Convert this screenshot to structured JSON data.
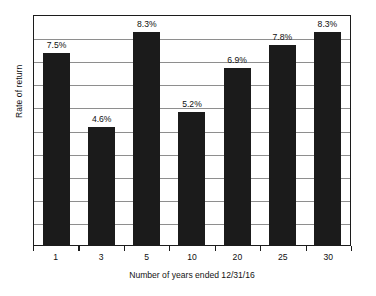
{
  "chart_data": {
    "type": "bar",
    "title": "",
    "xlabel": "Number of years ended 12/31/16",
    "ylabel": "Rate of return",
    "categories": [
      "1",
      "3",
      "5",
      "10",
      "20",
      "25",
      "30"
    ],
    "values": [
      7.5,
      4.6,
      8.3,
      5.2,
      6.9,
      7.8,
      8.3
    ],
    "value_labels": [
      "7.5%",
      "4.6%",
      "8.3%",
      "5.2%",
      "6.9%",
      "7.8%",
      "8.3%"
    ],
    "ylim": [
      0,
      9.0
    ],
    "ytick_labels": [],
    "grid": true,
    "gridline_count": 9,
    "legend": null,
    "bar_color": "#1b1b1b",
    "frame_color": "#1c1c1c",
    "gridline_color": "#8e8e8e",
    "background": "#ffffff"
  }
}
